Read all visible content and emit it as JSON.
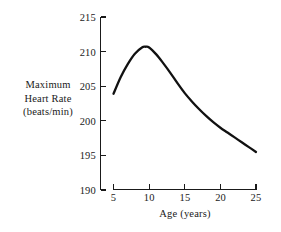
{
  "figure": {
    "background_color": "#ffffff",
    "ink_color": "#111111"
  },
  "chart_data": {
    "type": "line",
    "title": "",
    "subtitle": "",
    "xlabel": "Age (years)",
    "ylabel": "Maximum Heart Rate (beats/min)",
    "ylabel_lines": [
      "Maximum",
      "Heart Rate",
      "(beats/min)"
    ],
    "xlim": [
      5,
      25
    ],
    "ylim": [
      190,
      215
    ],
    "xticks": [
      5,
      10,
      15,
      20,
      25
    ],
    "xtick_labels": [
      "5",
      "10",
      "15",
      "20",
      "25"
    ],
    "yticks": [
      190,
      195,
      200,
      205,
      210,
      215
    ],
    "ytick_labels": [
      "190",
      "195",
      "200",
      "205",
      "210",
      "215"
    ],
    "grid": false,
    "legend": null,
    "annotations": [],
    "series": [
      {
        "name": "Maximum Heart Rate",
        "color": "#111111",
        "x": [
          5,
          6,
          7,
          8,
          9,
          9.5,
          10,
          11,
          12,
          13,
          14,
          15,
          16,
          17,
          18,
          19,
          20,
          21,
          22,
          23,
          24,
          25
        ],
        "values": [
          203.9,
          206.3,
          208.2,
          209.7,
          210.6,
          210.7,
          210.6,
          209.6,
          208.3,
          206.9,
          205.4,
          204.0,
          202.8,
          201.7,
          200.7,
          199.8,
          199.0,
          198.3,
          197.6,
          196.9,
          196.2,
          195.5
        ]
      }
    ]
  },
  "axes": {
    "x_axis_name": "x-axis",
    "y_axis_name": "y-axis"
  }
}
